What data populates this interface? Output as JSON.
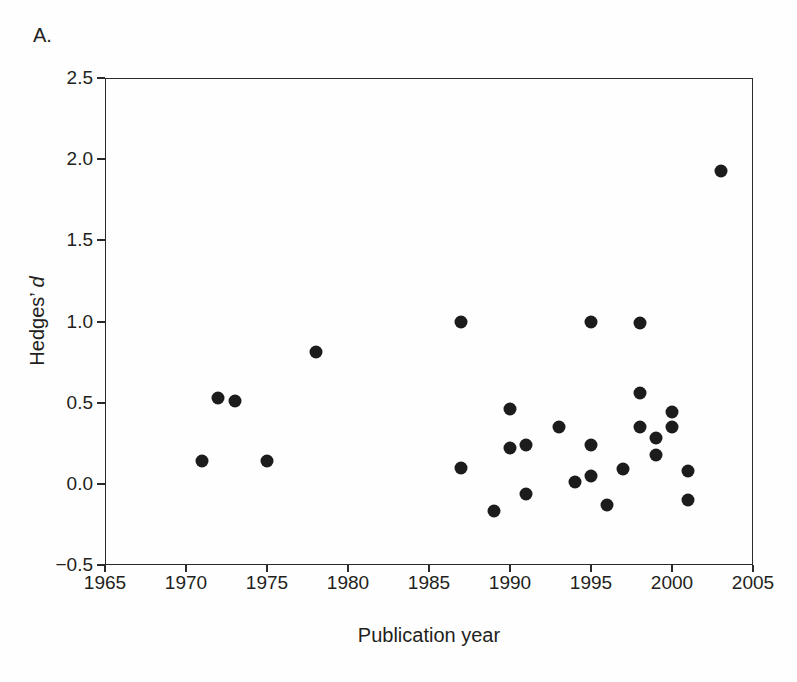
{
  "figure": {
    "panel_label": "A.",
    "background": "#fefefe",
    "ink_color": "#231f20"
  },
  "chart_data": {
    "type": "scatter",
    "title": "",
    "xlabel": "Publication year",
    "ylabel": "Hedges’ d",
    "ylabel_regular": "Hedges’ ",
    "ylabel_italic": "d",
    "xlim": [
      1965,
      2005
    ],
    "ylim": [
      -0.5,
      2.5
    ],
    "grid": false,
    "legend": "none",
    "marker": {
      "shape": "circle",
      "color": "#1c1c1c",
      "diameter_px": 13
    },
    "x_ticks": [
      {
        "value": 1965,
        "label": "1965"
      },
      {
        "value": 1970,
        "label": "1970"
      },
      {
        "value": 1975,
        "label": "1975"
      },
      {
        "value": 1980,
        "label": "1980"
      },
      {
        "value": 1985,
        "label": "1985"
      },
      {
        "value": 1990,
        "label": "1990"
      },
      {
        "value": 1995,
        "label": "1995"
      },
      {
        "value": 2000,
        "label": "2000"
      },
      {
        "value": 2005,
        "label": "2005"
      }
    ],
    "y_ticks": [
      {
        "value": 2.5,
        "label": "2.5"
      },
      {
        "value": 2.0,
        "label": "2.0"
      },
      {
        "value": 1.5,
        "label": "1.5"
      },
      {
        "value": 1.0,
        "label": "1.0"
      },
      {
        "value": 0.5,
        "label": "0.5"
      },
      {
        "value": 0.0,
        "label": "0.0"
      },
      {
        "value": -0.5,
        "label": "−0.5"
      }
    ],
    "points": [
      {
        "year": 1971,
        "d": 0.14
      },
      {
        "year": 1972,
        "d": 0.53
      },
      {
        "year": 1973,
        "d": 0.51
      },
      {
        "year": 1975,
        "d": 0.14
      },
      {
        "year": 1978,
        "d": 0.81
      },
      {
        "year": 1987,
        "d": 1.0
      },
      {
        "year": 1987,
        "d": 0.1
      },
      {
        "year": 1989,
        "d": -0.17
      },
      {
        "year": 1990,
        "d": 0.46
      },
      {
        "year": 1990,
        "d": 0.22
      },
      {
        "year": 1991,
        "d": 0.24
      },
      {
        "year": 1991,
        "d": -0.06
      },
      {
        "year": 1993,
        "d": 0.35
      },
      {
        "year": 1994,
        "d": 0.01
      },
      {
        "year": 1995,
        "d": 1.0
      },
      {
        "year": 1995,
        "d": 0.24
      },
      {
        "year": 1995,
        "d": 0.05
      },
      {
        "year": 1996,
        "d": -0.13
      },
      {
        "year": 1997,
        "d": 0.09
      },
      {
        "year": 1998,
        "d": 0.99
      },
      {
        "year": 1998,
        "d": 0.56
      },
      {
        "year": 1998,
        "d": 0.35
      },
      {
        "year": 1999,
        "d": 0.28
      },
      {
        "year": 1999,
        "d": 0.18
      },
      {
        "year": 2000,
        "d": 0.44
      },
      {
        "year": 2000,
        "d": 0.35
      },
      {
        "year": 2001,
        "d": 0.08
      },
      {
        "year": 2001,
        "d": -0.1
      },
      {
        "year": 2003,
        "d": 1.93
      }
    ]
  }
}
